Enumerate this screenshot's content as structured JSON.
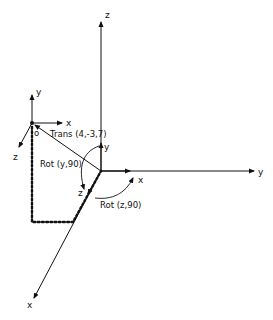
{
  "diagram": {
    "type": "coordinate-frame-transformation",
    "colors": {
      "line": "#111111",
      "background": "#ffffff"
    },
    "world_frame": {
      "axis_labels": {
        "x": "x",
        "y": "y",
        "z": "z"
      }
    },
    "local_frame": {
      "origin_label": "o",
      "axis_labels": {
        "x": "x",
        "y": "y",
        "z": "z"
      }
    },
    "rotated_frame": {
      "axis_labels": {
        "x": "x",
        "y": "y",
        "z": "z"
      }
    },
    "transforms": [
      {
        "label": "Trans (4,-3,7)"
      },
      {
        "label": "Rot (y,90)"
      },
      {
        "label": "Rot (z,90)"
      }
    ]
  }
}
